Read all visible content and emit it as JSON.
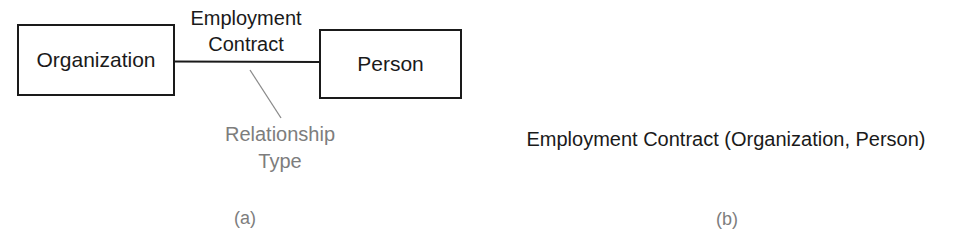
{
  "diagram_a": {
    "entities": [
      {
        "id": "organization",
        "label": "Organization"
      },
      {
        "id": "person",
        "label": "Person"
      }
    ],
    "relationship": {
      "label_line1": "Employment",
      "label_line2": "Contract",
      "from": "organization",
      "to": "person"
    },
    "annotation": {
      "line1": "Relationship",
      "line2": "Type",
      "color": "#7d7d7d"
    },
    "caption": "(a)"
  },
  "diagram_b": {
    "notation": "Employment Contract (Organization, Person)",
    "caption": "(b)"
  }
}
